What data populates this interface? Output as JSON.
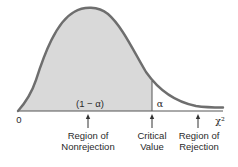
{
  "diagram": {
    "type": "chi-square distribution with rejection region",
    "colors": {
      "curve": "#6e6e6e",
      "shaded_region": "#d9d9d9",
      "axis": "#555555",
      "text": "#2a2a2a"
    },
    "axis": {
      "origin_label": "0",
      "x_axis_label": "χ²"
    },
    "regions": {
      "nonrejection_area_label": "(1 − α)",
      "rejection_area_label": "α"
    },
    "annotations": [
      {
        "line1": "Region of",
        "line2": "Nonrejection"
      },
      {
        "line1": "Critical",
        "line2": "Value"
      },
      {
        "line1": "Region of",
        "line2": "Rejection"
      }
    ]
  }
}
